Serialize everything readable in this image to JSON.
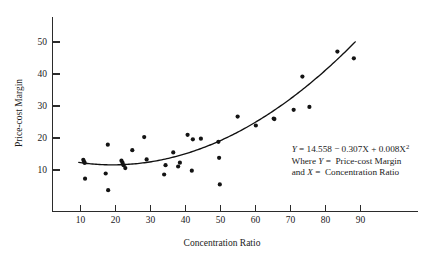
{
  "chart_data": {
    "type": "scatter",
    "title": "",
    "xlabel": "Concentration Ratio",
    "ylabel": "Price-cost Margin",
    "xlim": [
      0,
      97
    ],
    "ylim": [
      0,
      57
    ],
    "xticks": [
      10,
      20,
      30,
      40,
      50,
      60,
      70,
      80,
      90
    ],
    "xticklabels": [
      "10",
      "20",
      "30",
      "40",
      "50",
      "60",
      "70",
      "80",
      "90"
    ],
    "yticks": [
      10,
      20,
      30,
      40,
      50
    ],
    "yticklabels": [
      "10",
      "20",
      "30",
      "40",
      "50"
    ],
    "grid": false,
    "legend": null,
    "marker_color": "#141414",
    "curve_color": "#111111",
    "points": [
      {
        "x": 10.8,
        "y": 13.2
      },
      {
        "x": 11.0,
        "y": 12.6
      },
      {
        "x": 11.2,
        "y": 12.2
      },
      {
        "x": 11.3,
        "y": 7.3
      },
      {
        "x": 17.2,
        "y": 8.9
      },
      {
        "x": 17.8,
        "y": 17.9
      },
      {
        "x": 17.9,
        "y": 3.7
      },
      {
        "x": 21.7,
        "y": 12.9
      },
      {
        "x": 22.0,
        "y": 12.3
      },
      {
        "x": 22.3,
        "y": 11.5
      },
      {
        "x": 22.8,
        "y": 10.6
      },
      {
        "x": 24.8,
        "y": 16.2
      },
      {
        "x": 28.2,
        "y": 20.3
      },
      {
        "x": 28.9,
        "y": 13.3
      },
      {
        "x": 33.9,
        "y": 8.6
      },
      {
        "x": 34.3,
        "y": 11.5
      },
      {
        "x": 36.5,
        "y": 15.5
      },
      {
        "x": 37.9,
        "y": 11.1
      },
      {
        "x": 38.4,
        "y": 12.3
      },
      {
        "x": 40.6,
        "y": 21.0
      },
      {
        "x": 41.8,
        "y": 9.8
      },
      {
        "x": 42.1,
        "y": 19.6
      },
      {
        "x": 44.4,
        "y": 19.8
      },
      {
        "x": 49.4,
        "y": 18.8
      },
      {
        "x": 49.6,
        "y": 13.8
      },
      {
        "x": 49.8,
        "y": 5.5
      },
      {
        "x": 54.9,
        "y": 26.7
      },
      {
        "x": 60.1,
        "y": 23.9
      },
      {
        "x": 65.2,
        "y": 26.1
      },
      {
        "x": 65.4,
        "y": 25.9
      },
      {
        "x": 70.9,
        "y": 28.8
      },
      {
        "x": 73.4,
        "y": 39.2
      },
      {
        "x": 75.4,
        "y": 29.7
      },
      {
        "x": 83.4,
        "y": 47.0
      },
      {
        "x": 88.1,
        "y": 44.9
      }
    ],
    "fit": {
      "kind": "quadratic",
      "intercept": 14.558,
      "linear_coef": -0.307,
      "quadratic_coef": 0.008,
      "x_start": 9.5,
      "x_end": 88.5,
      "equation_text": "Y = 14.558 − 0.307X + 0.008X²"
    }
  },
  "annotation": {
    "line1_prefix": "Y",
    "line1_rest": " = 14.558 − 0.307X + 0.008X",
    "line1_superscript": "2",
    "line2_prefix": "Where ",
    "line2_var": "Y",
    "line2_rest": " =  Price-cost Margin",
    "line3_prefix": "and ",
    "line3_var": "X",
    "line3_rest": " =  Concentration Ratio"
  }
}
